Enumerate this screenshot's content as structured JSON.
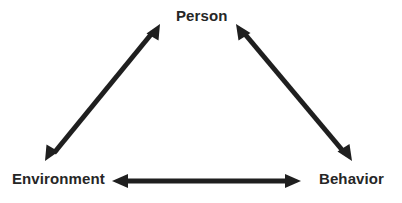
{
  "diagram": {
    "type": "triadic-reciprocal-model",
    "background_color": "#ffffff",
    "ink_color": "#1f1f1f",
    "text_color": "#262626",
    "nodes": [
      {
        "id": "person",
        "label": "Person",
        "position": "top-center"
      },
      {
        "id": "environment",
        "label": "Environment",
        "position": "bottom-left"
      },
      {
        "id": "behavior",
        "label": "Behavior",
        "position": "bottom-right"
      }
    ],
    "connections": [
      {
        "id": "environment-person",
        "from": "Environment",
        "to": "Person",
        "style": "double-headed-arrow",
        "orientation": "diagonal-left"
      },
      {
        "id": "person-behavior",
        "from": "Person",
        "to": "Behavior",
        "style": "double-headed-arrow",
        "orientation": "diagonal-right"
      },
      {
        "id": "environment-behavior",
        "from": "Environment",
        "to": "Behavior",
        "style": "double-headed-arrow",
        "orientation": "horizontal"
      }
    ]
  }
}
